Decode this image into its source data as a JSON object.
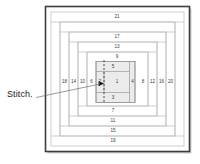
{
  "diagram": {
    "callout_label": "Stitch.",
    "center_strip": "1",
    "vertical_above": [
      "5",
      "9",
      "13",
      "17",
      "21"
    ],
    "vertical_below": [
      "3",
      "7",
      "11",
      "15",
      "19"
    ],
    "horizontal_left": [
      "2",
      "6",
      "10",
      "14",
      "18"
    ],
    "horizontal_right": [
      "4",
      "8",
      "12",
      "16",
      "20"
    ],
    "strip_numbers": [
      "1",
      "2",
      "3",
      "4",
      "5",
      "6",
      "7",
      "8",
      "9",
      "10",
      "11",
      "12",
      "13",
      "14",
      "15",
      "16",
      "17",
      "18",
      "19",
      "20",
      "21"
    ],
    "marker": "stitch-arrow",
    "stitch_line_style": "dashed",
    "colors": {
      "frame": "#3d3d3d",
      "strip_line": "#b9b9b9",
      "shade": "#ececec",
      "text": "#3a3a3a",
      "label_text": "#1a1a1a",
      "leader": "#6f6f6f",
      "background": "#ffffff"
    }
  }
}
